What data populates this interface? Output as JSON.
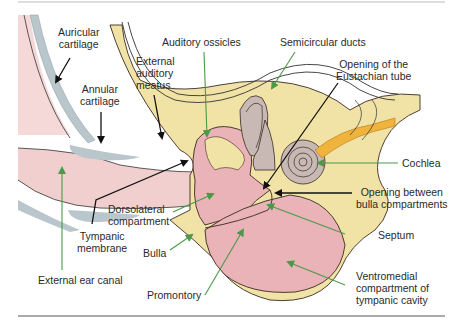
{
  "diagram": {
    "type": "anatomical cross-section",
    "colors": {
      "bone": "#f1e3a6",
      "soft_tissue_pink": "#e9b3b8",
      "canal_pink": "#f2cfcf",
      "cartilage_gray": "#b9c6cc",
      "inner_ear_gray": "#c9b9b4",
      "nerve_orange": "#f0b33c",
      "green_pointer": "#4a9a4a",
      "black_pointer": "#111111",
      "outline": "#3a2a22"
    },
    "labels": {
      "auricular_cartilage": "Auricular\ncartilage",
      "annular_cartilage": "Annular\ncartilage",
      "external_auditory_meatus": "External\nauditory\nmeatus",
      "auditory_ossicles": "Auditory ossicles",
      "semicircular_ducts": "Semicircular ducts",
      "opening_eustachian": "Opening of the\nEustachian tube",
      "cochlea": "Cochlea",
      "opening_between": "Opening between\nbulla compartments",
      "septum": "Septum",
      "ventromedial": "Ventromedial\ncompartment of\ntympanic cavity",
      "dorsolateral": "Dorsolateral\ncompartment",
      "tympanic_membrane": "Tympanic\nmembrane",
      "bulla": "Bulla",
      "promontory": "Promontory",
      "external_ear_canal": "External ear canal"
    }
  }
}
